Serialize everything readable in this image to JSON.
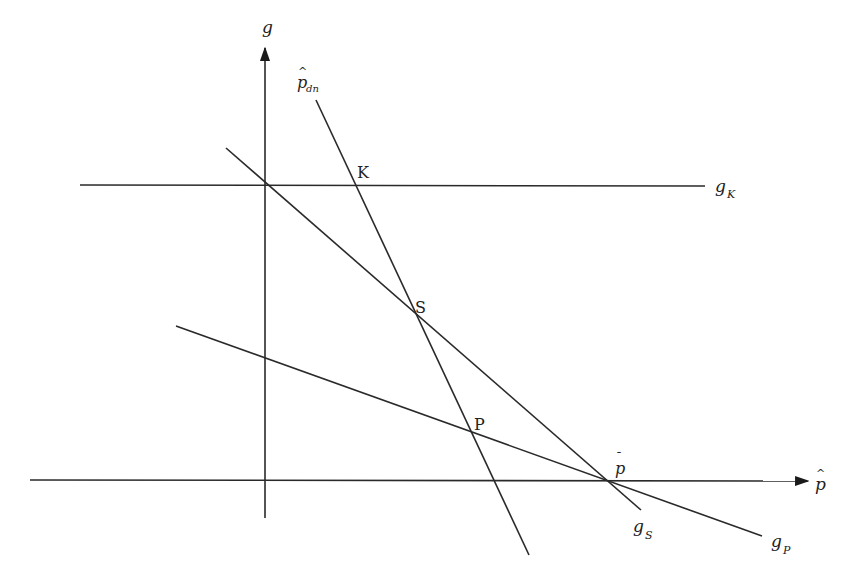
{
  "diagram": {
    "type": "economics-line-diagram",
    "axes": {
      "y_label": "g",
      "x_label": "p",
      "x_label_accent": "^"
    },
    "lines": [
      {
        "id": "g_K",
        "label_main": "g",
        "label_sub": "K",
        "kind": "horizontal"
      },
      {
        "id": "p_dn",
        "label_main": "p",
        "label_sub": "dn",
        "label_accent": "^",
        "kind": "steep-downward"
      },
      {
        "id": "g_S",
        "label_main": "g",
        "label_sub": "S",
        "kind": "downward"
      },
      {
        "id": "g_P",
        "label_main": "g",
        "label_sub": "P",
        "kind": "shallow-downward"
      }
    ],
    "points": [
      {
        "id": "K",
        "label": "K"
      },
      {
        "id": "S",
        "label": "S"
      },
      {
        "id": "P",
        "label": "P"
      },
      {
        "id": "p_bar",
        "label": "p",
        "accent": "¯"
      }
    ],
    "colors": {
      "ink": "#2a2a2a",
      "background": "#ffffff"
    }
  }
}
